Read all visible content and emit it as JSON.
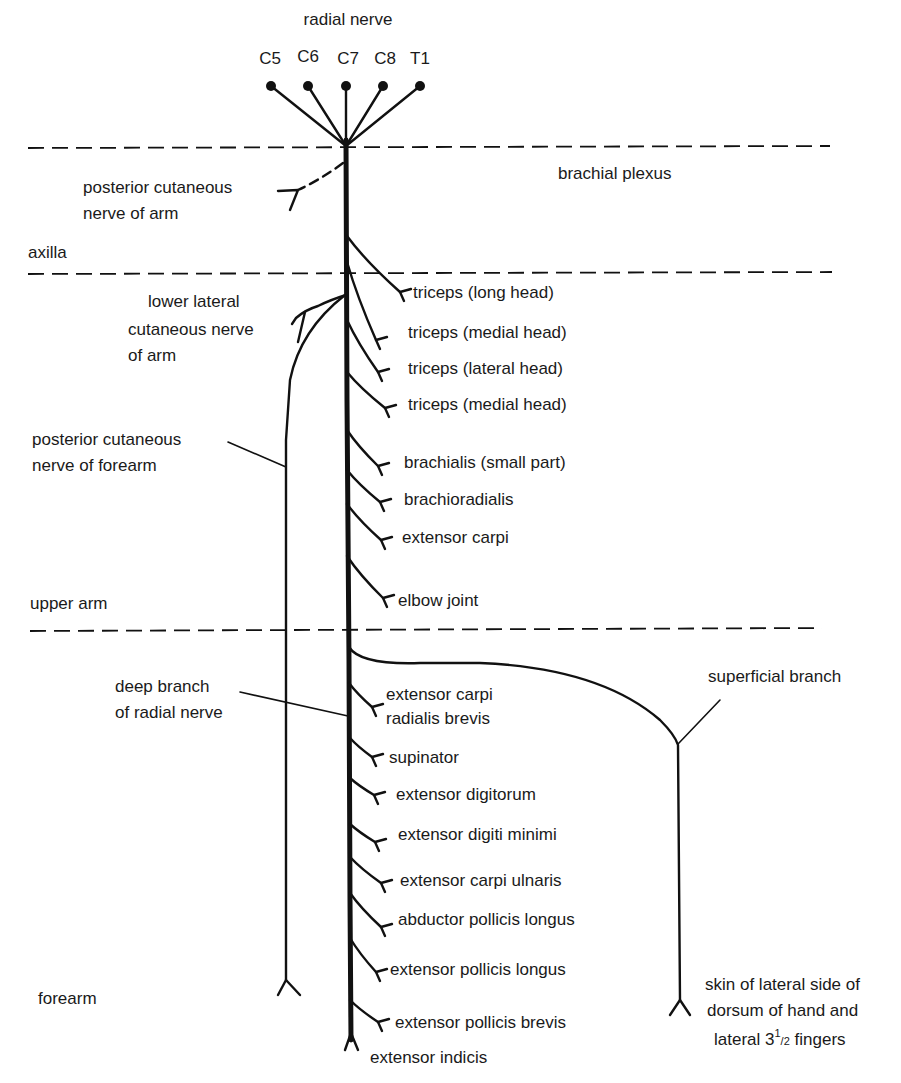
{
  "title": "radial nerve",
  "roots": [
    "C5",
    "C6",
    "C7",
    "C8",
    "T1"
  ],
  "regions": {
    "brachial_plexus": "brachial plexus",
    "axilla": "axilla",
    "upper_arm": "upper arm",
    "forearm": "forearm"
  },
  "cutaneous": {
    "posterior_arm_1": "posterior cutaneous",
    "posterior_arm_2": "nerve of arm",
    "lower_lateral_1": "lower lateral",
    "lower_lateral_2": "cutaneous nerve",
    "lower_lateral_3": "of arm",
    "posterior_forearm_1": "posterior cutaneous",
    "posterior_forearm_2": "nerve of forearm"
  },
  "upper_arm_branches": [
    "triceps (long head)",
    "triceps (medial head)",
    "triceps (lateral head)",
    "triceps (medial head)",
    "brachialis (small part)",
    "brachioradialis",
    "extensor carpi",
    "elbow joint"
  ],
  "deep_branch": {
    "label_1": "deep branch",
    "label_2": "of radial nerve"
  },
  "forearm_branches": {
    "ecrb_1": "extensor carpi",
    "ecrb_2": "radialis brevis",
    "items": [
      "supinator",
      "extensor digitorum",
      "extensor digiti minimi",
      "extensor carpi ulnaris",
      "abductor pollicis longus",
      "extensor pollicis longus",
      "extensor pollicis brevis",
      "extensor indicis"
    ]
  },
  "superficial_branch": {
    "label": "superficial branch",
    "target_1": "skin of lateral side of",
    "target_2": "dorsum of hand and",
    "target_3_prefix": "lateral 3",
    "target_3_sup": "1",
    "target_3_frac": "/2",
    "target_3_suffix": " fingers"
  }
}
